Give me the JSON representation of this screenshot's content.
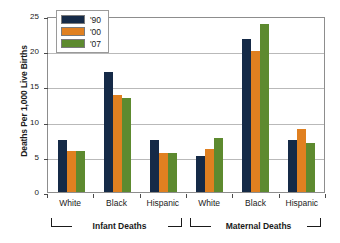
{
  "chart_data": {
    "type": "bar",
    "title": "",
    "xlabel": "",
    "ylabel": "Deaths Per 1,000 Live Births",
    "ylim": [
      0,
      25
    ],
    "yticks": [
      0,
      5,
      10,
      15,
      20,
      25
    ],
    "grid": true,
    "legend_position": "top-left inside plot",
    "categories": [
      "White",
      "Black",
      "Hispanic",
      "White",
      "Black",
      "Hispanic"
    ],
    "group_labels": [
      "Infant Deaths",
      "Maternal Deaths"
    ],
    "series": [
      {
        "name": "'90",
        "color": "#152a47",
        "values": [
          7.4,
          17.0,
          7.4,
          5.1,
          21.7,
          7.4
        ]
      },
      {
        "name": "'00",
        "color": "#e08020",
        "values": [
          5.8,
          13.8,
          5.6,
          6.1,
          20.0,
          8.9
        ]
      },
      {
        "name": "'07",
        "color": "#5d8a2f",
        "values": [
          5.8,
          13.3,
          5.6,
          7.7,
          23.8,
          7.0
        ]
      }
    ]
  },
  "axis": {
    "y_title": "Deaths Per 1,000 Live Births",
    "y_tick_labels": [
      "25",
      "20",
      "15",
      "10",
      "5",
      "0"
    ]
  },
  "legend": {
    "items": [
      {
        "label": "'90",
        "color": "#152a47",
        "swatch_name": "legend-swatch-1990"
      },
      {
        "label": "'00",
        "color": "#e08020",
        "swatch_name": "legend-swatch-2000"
      },
      {
        "label": "'07",
        "color": "#5d8a2f",
        "swatch_name": "legend-swatch-2007"
      }
    ]
  },
  "x_axis": {
    "tick_labels": [
      "White",
      "Black",
      "Hispanic",
      "White",
      "Black",
      "Hispanic"
    ],
    "brackets": [
      {
        "label": "Infant Deaths"
      },
      {
        "label": "Maternal Deaths"
      }
    ]
  }
}
